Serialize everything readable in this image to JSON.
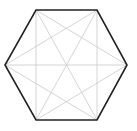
{
  "diagram": {
    "type": "complete-graph-hexagon",
    "vertices": [
      {
        "x": 36,
        "y": 10
      },
      {
        "x": 97,
        "y": 10
      },
      {
        "x": 127,
        "y": 65
      },
      {
        "x": 97,
        "y": 120
      },
      {
        "x": 36,
        "y": 120
      },
      {
        "x": 5,
        "y": 65
      }
    ],
    "outline_color": "#222222",
    "diagonal_color": "#cfcfcf",
    "outline_width": 1.6,
    "diagonal_width": 0.9
  }
}
